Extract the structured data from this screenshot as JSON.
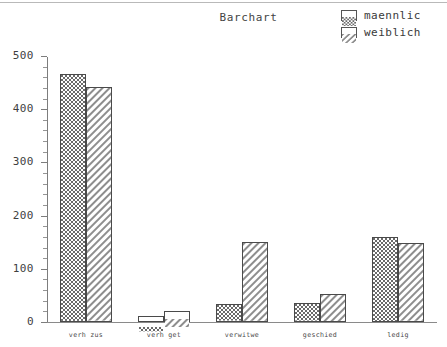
{
  "chart_data": {
    "type": "bar",
    "title": "Barchart",
    "xlabel": "",
    "ylabel": "",
    "categories": [
      "verh zus",
      "verh get",
      "verwitwe",
      "geschied",
      "ledig"
    ],
    "series": [
      {
        "name": "maennlic",
        "pattern": "crosshatch",
        "values": [
          466,
          12,
          33,
          35,
          160
        ]
      },
      {
        "name": "weiblich",
        "pattern": "diagonal",
        "values": [
          441,
          20,
          150,
          53,
          148
        ]
      }
    ],
    "ylim": [
      0,
      500
    ],
    "yticks": [
      0,
      100,
      200,
      300,
      400,
      500
    ],
    "ytick_labels": [
      "0",
      "100",
      "200",
      "300",
      "400",
      "500"
    ],
    "minor_tick_step": 20,
    "grid": false,
    "legend_position": "top-right"
  },
  "legend": {
    "entries": [
      {
        "label": "maennlic",
        "pattern": "crosshatch"
      },
      {
        "label": "weiblich",
        "pattern": "diagonal"
      }
    ]
  },
  "colors": {
    "axis": "#7d7d7d",
    "bar_outline": "#4a4a4a",
    "text": "#3a3a3a",
    "background": "#ffffff"
  }
}
